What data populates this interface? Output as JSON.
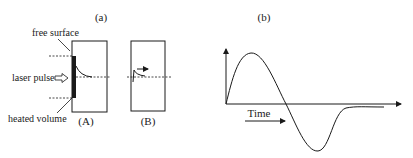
{
  "panel_a": {
    "title": "(a)",
    "labels": {
      "free_surface": "free surface",
      "laser_pulse": "laser pulse",
      "heated_volume": "heated volume"
    },
    "subpanels": [
      {
        "label": "(A)"
      },
      {
        "label": "(B)"
      }
    ]
  },
  "panel_b": {
    "title": "(b)",
    "axis_label": "Time"
  },
  "colors": {
    "line": "#1a1a1a",
    "background": "#ffffff"
  }
}
